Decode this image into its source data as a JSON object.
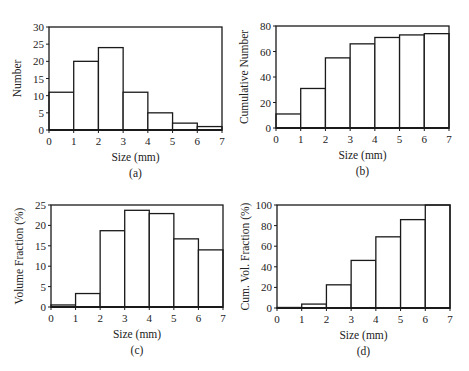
{
  "chart_data": [
    {
      "id": "a",
      "type": "bar",
      "panel_label": "(a)",
      "title": "",
      "xlabel": "Size (mm)",
      "ylabel": "Number",
      "x_edges": [
        0,
        1,
        2,
        3,
        4,
        5,
        6,
        7
      ],
      "categories": [
        "0-1",
        "1-2",
        "2-3",
        "3-4",
        "4-5",
        "5-6",
        "6-7"
      ],
      "values": [
        11,
        20,
        24,
        11,
        5,
        2,
        1
      ],
      "xlim": [
        0,
        7
      ],
      "ylim": [
        0,
        30
      ],
      "xticks": [
        0,
        1,
        2,
        3,
        4,
        5,
        6,
        7
      ],
      "yticks": [
        0,
        5,
        10,
        15,
        20,
        25,
        30
      ],
      "grid": false,
      "legend": null,
      "frame": {
        "left": 49,
        "top": 27,
        "right": 222,
        "bottom": 130
      }
    },
    {
      "id": "b",
      "type": "bar",
      "panel_label": "(b)",
      "title": "",
      "xlabel": "Size (mm)",
      "ylabel": "Cumulative Number",
      "x_edges": [
        0,
        1,
        2,
        3,
        4,
        5,
        6,
        7
      ],
      "categories": [
        "0-1",
        "1-2",
        "2-3",
        "3-4",
        "4-5",
        "5-6",
        "6-7"
      ],
      "values": [
        11,
        31,
        55,
        66,
        71,
        73,
        74
      ],
      "xlim": [
        0,
        7
      ],
      "ylim": [
        0,
        80
      ],
      "xticks": [
        0,
        1,
        2,
        3,
        4,
        5,
        6,
        7
      ],
      "yticks": [
        0,
        20,
        40,
        60,
        80
      ],
      "grid": false,
      "legend": null,
      "frame": {
        "left": 276,
        "top": 26,
        "right": 449,
        "bottom": 128
      }
    },
    {
      "id": "c",
      "type": "bar",
      "panel_label": "(c)",
      "title": "",
      "xlabel": "Size (mm)",
      "ylabel": "Volume Fraction (%)",
      "x_edges": [
        0,
        1,
        2,
        3,
        4,
        5,
        6,
        7
      ],
      "categories": [
        "0-1",
        "1-2",
        "2-3",
        "3-4",
        "4-5",
        "5-6",
        "6-7"
      ],
      "values": [
        0.5,
        3.3,
        18.7,
        23.7,
        22.9,
        16.7,
        14.0
      ],
      "xlim": [
        0,
        7
      ],
      "ylim": [
        0,
        25
      ],
      "xticks": [
        0,
        1,
        2,
        3,
        4,
        5,
        6,
        7
      ],
      "yticks": [
        0,
        5,
        10,
        15,
        20,
        25
      ],
      "grid": false,
      "legend": null,
      "frame": {
        "left": 51,
        "top": 205,
        "right": 223,
        "bottom": 307
      }
    },
    {
      "id": "d",
      "type": "bar",
      "panel_label": "(d)",
      "title": "",
      "xlabel": "Size (mm)",
      "ylabel": "Cum. Vol. Fraction (%)",
      "x_edges": [
        0,
        1,
        2,
        3,
        4,
        5,
        6,
        7
      ],
      "categories": [
        "0-1",
        "1-2",
        "2-3",
        "3-4",
        "4-5",
        "5-6",
        "6-7"
      ],
      "values": [
        0.5,
        3.8,
        22.5,
        46.2,
        69.1,
        85.8,
        100
      ],
      "xlim": [
        0,
        7
      ],
      "ylim": [
        0,
        100
      ],
      "xticks": [
        0,
        1,
        2,
        3,
        4,
        5,
        6,
        7
      ],
      "yticks": [
        0,
        20,
        40,
        60,
        80,
        100
      ],
      "grid": false,
      "legend": null,
      "frame": {
        "left": 277,
        "top": 205,
        "right": 450,
        "bottom": 308
      }
    }
  ],
  "style": {
    "line_color": "#1a1a1a",
    "bar_fill": "#ffffff",
    "text_color": "#222222"
  }
}
